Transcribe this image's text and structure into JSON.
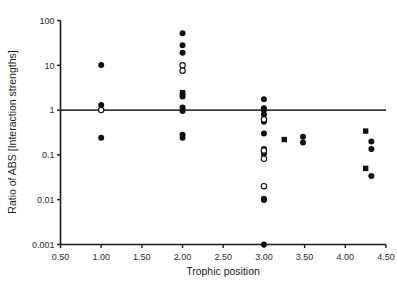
{
  "chart_data": {
    "type": "scatter",
    "title": "",
    "xlabel": "Trophic position",
    "ylabel": "Ratio of ABS [Interaction strengths]",
    "yscale": "log",
    "xlim": [
      0.5,
      4.5
    ],
    "ylim": [
      0.001,
      100
    ],
    "xticks": [
      "0.50",
      "1.00",
      "1.50",
      "2.00",
      "2.50",
      "3.00",
      "3.50",
      "4.00",
      "4.50"
    ],
    "xtick_values": [
      0.5,
      1.0,
      1.5,
      2.0,
      2.5,
      3.0,
      3.5,
      4.0,
      4.5
    ],
    "yticks": [
      "100",
      "10",
      "1",
      "0.1",
      "0.01",
      "0.001"
    ],
    "ytick_values": [
      100,
      10,
      1,
      0.1,
      0.01,
      0.001
    ],
    "grid": false,
    "legend": "none",
    "annotations": [
      {
        "type": "hline",
        "y": 1,
        "label": "reference line at ratio = 1"
      }
    ],
    "marker_colors": {
      "filled": "#101010",
      "open_fill": "#ffffff",
      "open_stroke": "#101010"
    },
    "series": [
      {
        "name": "filled circles",
        "marker": "filled-circle",
        "points": [
          {
            "x": 1.0,
            "y": 10.2
          },
          {
            "x": 1.0,
            "y": 1.3
          },
          {
            "x": 1.0,
            "y": 0.24
          },
          {
            "x": 2.0,
            "y": 52
          },
          {
            "x": 2.0,
            "y": 28
          },
          {
            "x": 2.0,
            "y": 19
          },
          {
            "x": 2.0,
            "y": 2.3
          },
          {
            "x": 2.0,
            "y": 2.0
          },
          {
            "x": 2.0,
            "y": 1.15
          },
          {
            "x": 2.0,
            "y": 0.95
          },
          {
            "x": 2.0,
            "y": 0.28
          },
          {
            "x": 2.0,
            "y": 0.24
          },
          {
            "x": 3.0,
            "y": 1.75
          },
          {
            "x": 3.0,
            "y": 1.1
          },
          {
            "x": 3.0,
            "y": 1.0
          },
          {
            "x": 3.0,
            "y": 0.8
          },
          {
            "x": 3.0,
            "y": 0.6
          },
          {
            "x": 3.0,
            "y": 0.55
          },
          {
            "x": 3.0,
            "y": 0.3
          },
          {
            "x": 3.0,
            "y": 0.135
          },
          {
            "x": 3.0,
            "y": 0.105
          },
          {
            "x": 3.0,
            "y": 0.0105
          },
          {
            "x": 3.0,
            "y": 0.0098
          },
          {
            "x": 3.0,
            "y": 0.001
          },
          {
            "x": 3.48,
            "y": 0.255
          },
          {
            "x": 3.48,
            "y": 0.19
          },
          {
            "x": 4.32,
            "y": 0.2
          },
          {
            "x": 4.32,
            "y": 0.135
          },
          {
            "x": 4.32,
            "y": 0.034
          }
        ]
      },
      {
        "name": "open circles",
        "marker": "open-circle",
        "points": [
          {
            "x": 1.0,
            "y": 1.0
          },
          {
            "x": 2.0,
            "y": 10.0
          },
          {
            "x": 2.0,
            "y": 7.6
          },
          {
            "x": 3.0,
            "y": 0.62
          },
          {
            "x": 3.0,
            "y": 0.125
          },
          {
            "x": 3.0,
            "y": 0.082
          },
          {
            "x": 3.0,
            "y": 0.02
          }
        ]
      },
      {
        "name": "filled squares",
        "marker": "filled-square",
        "points": [
          {
            "x": 2.0,
            "y": 2.45
          },
          {
            "x": 3.25,
            "y": 0.22
          },
          {
            "x": 4.25,
            "y": 0.34
          },
          {
            "x": 4.25,
            "y": 0.05
          }
        ]
      }
    ]
  },
  "axes": {
    "x_title": "Trophic position",
    "y_title": "Ratio of ABS [Interaction strengths]"
  }
}
